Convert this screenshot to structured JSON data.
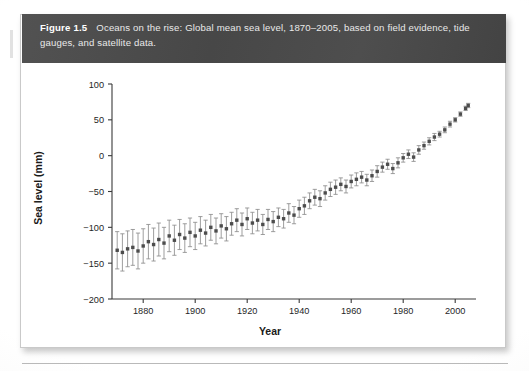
{
  "figure": {
    "label": "Figure 1.5",
    "caption": "Oceans on the rise: Global mean sea level, 1870–2005, based on field evidence, tide gauges, and satellite data."
  },
  "chart_data": {
    "type": "scatter",
    "title": "",
    "xlabel": "Year",
    "ylabel": "Sea level (mm)",
    "xlim": [
      1868,
      2008
    ],
    "ylim": [
      -200,
      100
    ],
    "xticks": [
      1880,
      1900,
      1920,
      1940,
      1960,
      1980,
      2000
    ],
    "yticks": [
      100,
      50,
      0,
      -50,
      -100,
      -150,
      -200
    ],
    "grid": false,
    "legend": null,
    "series_name": "Global mean sea level",
    "marker": "filled-square-with-vertical-error-bars",
    "marker_color": "#4d4d4d",
    "errorbar_color": "#8c8c8c",
    "x": [
      1870,
      1872,
      1874,
      1876,
      1878,
      1880,
      1882,
      1884,
      1886,
      1888,
      1890,
      1892,
      1894,
      1896,
      1898,
      1900,
      1902,
      1904,
      1906,
      1908,
      1910,
      1912,
      1914,
      1916,
      1918,
      1920,
      1922,
      1924,
      1926,
      1928,
      1930,
      1932,
      1934,
      1936,
      1938,
      1940,
      1942,
      1944,
      1946,
      1948,
      1950,
      1952,
      1954,
      1956,
      1958,
      1960,
      1962,
      1964,
      1966,
      1968,
      1970,
      1972,
      1974,
      1976,
      1978,
      1980,
      1982,
      1984,
      1986,
      1988,
      1990,
      1992,
      1994,
      1996,
      1998,
      2000,
      2002,
      2004,
      2005
    ],
    "y": [
      -132,
      -135,
      -130,
      -128,
      -133,
      -126,
      -120,
      -124,
      -117,
      -122,
      -112,
      -118,
      -110,
      -115,
      -107,
      -112,
      -104,
      -108,
      -100,
      -105,
      -98,
      -102,
      -95,
      -90,
      -96,
      -88,
      -94,
      -90,
      -96,
      -89,
      -92,
      -86,
      -88,
      -80,
      -83,
      -74,
      -70,
      -63,
      -58,
      -60,
      -52,
      -47,
      -44,
      -40,
      -43,
      -36,
      -33,
      -30,
      -34,
      -28,
      -22,
      -16,
      -12,
      -18,
      -10,
      -3,
      2,
      -2,
      8,
      14,
      20,
      26,
      30,
      36,
      44,
      50,
      58,
      66,
      70
    ],
    "yerr": [
      26,
      26,
      25,
      25,
      25,
      24,
      24,
      23,
      23,
      22,
      22,
      21,
      21,
      20,
      20,
      19,
      19,
      18,
      18,
      18,
      17,
      17,
      16,
      16,
      16,
      15,
      15,
      15,
      14,
      14,
      14,
      13,
      13,
      13,
      12,
      12,
      12,
      11,
      11,
      11,
      10,
      10,
      10,
      9,
      9,
      9,
      9,
      8,
      8,
      8,
      8,
      7,
      7,
      7,
      7,
      6,
      6,
      6,
      6,
      5,
      5,
      5,
      4,
      4,
      4,
      3,
      3,
      3,
      3
    ]
  }
}
